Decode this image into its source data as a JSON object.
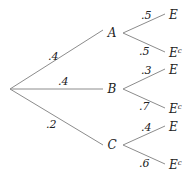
{
  "tree": {
    "root": {
      "x": 10,
      "y": 89
    },
    "first_level": [
      {
        "label": "A",
        "prob": ".4",
        "node": {
          "x": 112,
          "y": 33
        },
        "line_end": {
          "x": 103,
          "y": 30
        },
        "prob_pos": {
          "x": 48,
          "y": 60
        }
      },
      {
        "label": "B",
        "prob": ".4",
        "node": {
          "x": 112,
          "y": 89
        },
        "line_end": {
          "x": 103,
          "y": 89
        },
        "prob_pos": {
          "x": 58,
          "y": 85
        }
      },
      {
        "label": "C",
        "prob": ".2",
        "node": {
          "x": 112,
          "y": 145
        },
        "line_end": {
          "x": 103,
          "y": 145
        },
        "prob_pos": {
          "x": 46,
          "y": 128
        }
      }
    ],
    "second_level": [
      {
        "parent": "A",
        "branches": [
          {
            "label": "E",
            "sup": "",
            "prob": ".5",
            "start": {
              "x": 123,
              "y": 33
            },
            "end": {
              "x": 165,
              "y": 14
            },
            "label_pos": {
              "x": 169,
              "y": 19
            },
            "prob_pos": {
              "x": 141,
              "y": 19
            }
          },
          {
            "label": "E",
            "sup": "c",
            "prob": ".5",
            "start": {
              "x": 123,
              "y": 33
            },
            "end": {
              "x": 165,
              "y": 52
            },
            "label_pos": {
              "x": 169,
              "y": 57
            },
            "prob_pos": {
              "x": 139,
              "y": 55
            }
          }
        ]
      },
      {
        "parent": "B",
        "branches": [
          {
            "label": "E",
            "sup": "",
            "prob": ".3",
            "start": {
              "x": 123,
              "y": 89
            },
            "end": {
              "x": 165,
              "y": 69
            },
            "label_pos": {
              "x": 169,
              "y": 74
            },
            "prob_pos": {
              "x": 141,
              "y": 74
            }
          },
          {
            "label": "E",
            "sup": "c",
            "prob": ".7",
            "start": {
              "x": 123,
              "y": 89
            },
            "end": {
              "x": 165,
              "y": 108
            },
            "label_pos": {
              "x": 169,
              "y": 113
            },
            "prob_pos": {
              "x": 139,
              "y": 110
            }
          }
        ]
      },
      {
        "parent": "C",
        "branches": [
          {
            "label": "E",
            "sup": "",
            "prob": ".4",
            "start": {
              "x": 123,
              "y": 145
            },
            "end": {
              "x": 165,
              "y": 126
            },
            "label_pos": {
              "x": 169,
              "y": 131
            },
            "prob_pos": {
              "x": 141,
              "y": 131
            }
          },
          {
            "label": "E",
            "sup": "c",
            "prob": ".6",
            "start": {
              "x": 123,
              "y": 145
            },
            "end": {
              "x": 165,
              "y": 164
            },
            "label_pos": {
              "x": 169,
              "y": 169
            },
            "prob_pos": {
              "x": 139,
              "y": 167
            }
          }
        ]
      }
    ]
  },
  "colors": {
    "line": "#8c8c8c",
    "text": "#222222",
    "background": "#ffffff"
  }
}
